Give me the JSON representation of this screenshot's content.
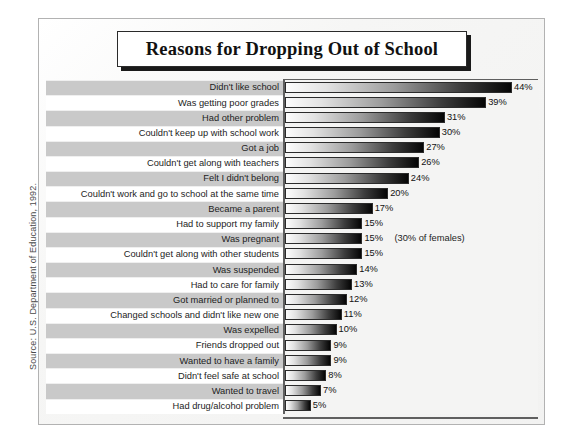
{
  "title": "Reasons for Dropping Out of School",
  "source_note": "Source: U.S. Department of Education, 1992.",
  "chart_data": {
    "type": "bar",
    "orientation": "horizontal",
    "title": "Reasons for Dropping Out of School",
    "xlabel": "",
    "ylabel": "",
    "xlim": [
      0,
      44
    ],
    "grid": false,
    "legend": null,
    "value_suffix": "%",
    "categories": [
      "Didn't like school",
      "Was getting poor grades",
      "Had other problem",
      "Couldn't keep up with school work",
      "Got a job",
      "Couldn't get along with teachers",
      "Felt I didn't belong",
      "Couldn't work and go to school at the same time",
      "Became a parent",
      "Had to support my family",
      "Was pregnant",
      "Couldn't get along with other students",
      "Was suspended",
      "Had to care for family",
      "Got married or planned to",
      "Changed schools and didn't like new one",
      "Was expelled",
      "Friends dropped out",
      "Wanted to have a family",
      "Didn't feel safe at school",
      "Wanted to travel",
      "Had drug/alcohol problem"
    ],
    "values": [
      44,
      39,
      31,
      30,
      27,
      26,
      24,
      20,
      17,
      15,
      15,
      15,
      14,
      13,
      12,
      11,
      10,
      9,
      9,
      8,
      7,
      5
    ],
    "value_labels": [
      "44%",
      "39%",
      "31%",
      "30%",
      "27%",
      "26%",
      "24%",
      "20%",
      "17%",
      "15%",
      "15%",
      "15%",
      "14%",
      "13%",
      "12%",
      "11%",
      "10%",
      "9%",
      "9%",
      "8%",
      "7%",
      "5%"
    ],
    "annotations": [
      {
        "category": "Was pregnant",
        "text": "(30% of females)"
      }
    ]
  },
  "rows": [
    {
      "label": "Didn't like school",
      "value": 44,
      "value_label": "44%",
      "note": ""
    },
    {
      "label": "Was getting poor grades",
      "value": 39,
      "value_label": "39%",
      "note": ""
    },
    {
      "label": "Had other problem",
      "value": 31,
      "value_label": "31%",
      "note": ""
    },
    {
      "label": "Couldn't keep up with school work",
      "value": 30,
      "value_label": "30%",
      "note": ""
    },
    {
      "label": "Got a job",
      "value": 27,
      "value_label": "27%",
      "note": ""
    },
    {
      "label": "Couldn't get along with teachers",
      "value": 26,
      "value_label": "26%",
      "note": ""
    },
    {
      "label": "Felt I didn't belong",
      "value": 24,
      "value_label": "24%",
      "note": ""
    },
    {
      "label": "Couldn't work and go to school at the same time",
      "value": 20,
      "value_label": "20%",
      "note": ""
    },
    {
      "label": "Became a parent",
      "value": 17,
      "value_label": "17%",
      "note": ""
    },
    {
      "label": "Had to support my family",
      "value": 15,
      "value_label": "15%",
      "note": ""
    },
    {
      "label": "Was pregnant",
      "value": 15,
      "value_label": "15%",
      "note": "(30% of females)"
    },
    {
      "label": "Couldn't get along with other students",
      "value": 15,
      "value_label": "15%",
      "note": ""
    },
    {
      "label": "Was suspended",
      "value": 14,
      "value_label": "14%",
      "note": ""
    },
    {
      "label": "Had to care for family",
      "value": 13,
      "value_label": "13%",
      "note": ""
    },
    {
      "label": "Got married or planned to",
      "value": 12,
      "value_label": "12%",
      "note": ""
    },
    {
      "label": "Changed schools and didn't like new one",
      "value": 11,
      "value_label": "11%",
      "note": ""
    },
    {
      "label": "Was expelled",
      "value": 10,
      "value_label": "10%",
      "note": ""
    },
    {
      "label": "Friends dropped out",
      "value": 9,
      "value_label": "9%",
      "note": ""
    },
    {
      "label": "Wanted to have a family",
      "value": 9,
      "value_label": "9%",
      "note": ""
    },
    {
      "label": "Didn't feel safe at school",
      "value": 8,
      "value_label": "8%",
      "note": ""
    },
    {
      "label": "Wanted to travel",
      "value": 7,
      "value_label": "7%",
      "note": ""
    },
    {
      "label": "Had drug/alcohol problem",
      "value": 5,
      "value_label": "5%",
      "note": ""
    }
  ],
  "colors": {
    "band_gray": "#c9c9c9",
    "band_white": "#ffffff",
    "bar_start": "#fdfdfd",
    "bar_end": "#050505",
    "frame": "#b2b2b2",
    "axis": "#5f5f5f",
    "text": "#1d1d1d"
  }
}
